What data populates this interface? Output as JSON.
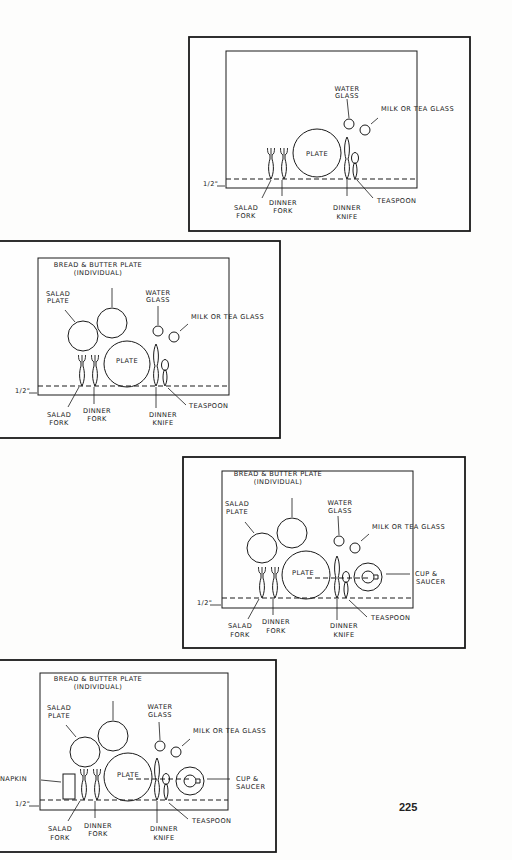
{
  "page_number": "225",
  "colors": {
    "ink": "#1a1a1a",
    "paper": "#fdfdfc"
  },
  "diagrams": [
    {
      "id": "basic",
      "labels": {
        "water_glass": [
          "WATER",
          "GLASS"
        ],
        "milk_glass": "MILK OR TEA GLASS",
        "plate": "PLATE",
        "salad_fork": [
          "SALAD",
          "FORK"
        ],
        "dinner_fork": [
          "DINNER",
          "FORK"
        ],
        "dinner_knife": [
          "DINNER",
          "KNIFE"
        ],
        "teaspoon": "TEASPOON",
        "margin": "1/2\""
      }
    },
    {
      "id": "with-salad-and-bread",
      "labels": {
        "bread_plate": [
          "BREAD & BUTTER PLATE",
          "(INDIVIDUAL)"
        ],
        "salad_plate": [
          "SALAD",
          "PLATE"
        ],
        "water_glass": [
          "WATER",
          "GLASS"
        ],
        "milk_glass": "MILK OR TEA GLASS",
        "plate": "PLATE",
        "salad_fork": [
          "SALAD",
          "FORK"
        ],
        "dinner_fork": [
          "DINNER",
          "FORK"
        ],
        "dinner_knife": [
          "DINNER",
          "KNIFE"
        ],
        "teaspoon": "TEASPOON",
        "margin": "1/2\""
      }
    },
    {
      "id": "with-cup-saucer",
      "labels": {
        "bread_plate": [
          "BREAD & BUTTER PLATE",
          "(INDIVIDUAL)"
        ],
        "salad_plate": [
          "SALAD",
          "PLATE"
        ],
        "water_glass": [
          "WATER",
          "GLASS"
        ],
        "milk_glass": "MILK OR TEA GLASS",
        "plate": "PLATE",
        "cup_saucer": [
          "CUP &",
          "SAUCER"
        ],
        "salad_fork": [
          "SALAD",
          "FORK"
        ],
        "dinner_fork": [
          "DINNER",
          "FORK"
        ],
        "dinner_knife": [
          "DINNER",
          "KNIFE"
        ],
        "teaspoon": "TEASPOON",
        "margin": "1/2\""
      }
    },
    {
      "id": "with-napkin",
      "labels": {
        "bread_plate": [
          "BREAD & BUTTER PLATE",
          "(INDIVIDUAL)"
        ],
        "salad_plate": [
          "SALAD",
          "PLATE"
        ],
        "water_glass": [
          "WATER",
          "GLASS"
        ],
        "milk_glass": "MILK OR TEA GLASS",
        "plate": "PLATE",
        "cup_saucer": [
          "CUP &",
          "SAUCER"
        ],
        "napkin": "NAPKIN",
        "salad_fork": [
          "SALAD",
          "FORK"
        ],
        "dinner_fork": [
          "DINNER",
          "FORK"
        ],
        "dinner_knife": [
          "DINNER",
          "KNIFE"
        ],
        "teaspoon": "TEASPOON",
        "margin": "1/2\""
      }
    }
  ]
}
